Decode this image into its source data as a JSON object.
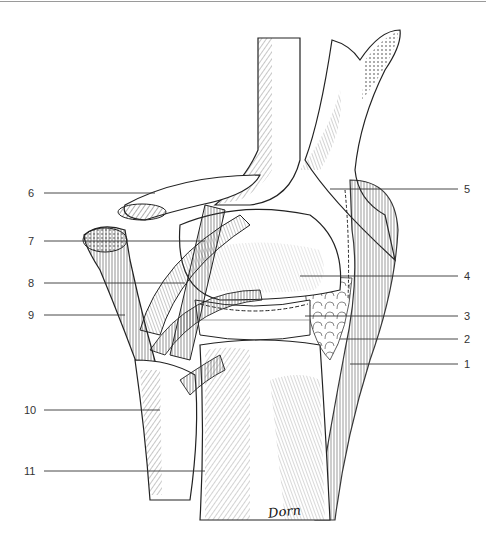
{
  "figure": {
    "type": "anatomical illustration",
    "signature": "Dorn",
    "line_color": "#222222",
    "background": "#ffffff"
  },
  "labels": {
    "left": [
      {
        "number": "6",
        "y": 193
      },
      {
        "number": "7",
        "y": 241
      },
      {
        "number": "8",
        "y": 283
      },
      {
        "number": "9",
        "y": 315
      },
      {
        "number": "10",
        "y": 410
      },
      {
        "number": "11",
        "y": 471
      }
    ],
    "right": [
      {
        "number": "5",
        "y": 189
      },
      {
        "number": "4",
        "y": 276
      },
      {
        "number": "3",
        "y": 316
      },
      {
        "number": "2",
        "y": 339
      },
      {
        "number": "1",
        "y": 364
      }
    ]
  }
}
